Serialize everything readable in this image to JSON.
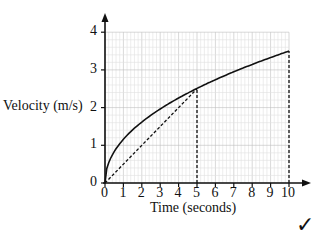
{
  "chart_data": {
    "type": "line",
    "title": "",
    "xlabel": "Time (seconds)",
    "ylabel": "Velocity (m/s)",
    "xlim": [
      0,
      10
    ],
    "ylim": [
      0,
      4
    ],
    "grid": true,
    "x_ticks": [
      "0",
      "1",
      "2",
      "3",
      "4",
      "5",
      "6",
      "7",
      "8",
      "9",
      "10"
    ],
    "y_ticks": [
      "0",
      "1",
      "2",
      "3",
      "4"
    ],
    "series": [
      {
        "name": "velocity curve",
        "style": "solid",
        "x": [
          0,
          0.25,
          0.5,
          1,
          2,
          3,
          4,
          5,
          6,
          7,
          8,
          9,
          10
        ],
        "y": [
          0,
          0.55,
          0.8,
          1.1,
          1.55,
          1.9,
          2.2,
          2.5,
          2.7,
          2.9,
          3.1,
          3.3,
          3.5
        ]
      },
      {
        "name": "chord 0-5",
        "style": "dashed",
        "x": [
          0,
          5
        ],
        "y": [
          0,
          2.5
        ]
      },
      {
        "name": "vertical at t=5",
        "style": "dashed",
        "x": [
          5,
          5
        ],
        "y": [
          0,
          2.5
        ]
      },
      {
        "name": "vertical at t=10",
        "style": "dashed",
        "x": [
          10,
          10
        ],
        "y": [
          0,
          3.5
        ]
      }
    ],
    "annotations": [
      "✓"
    ]
  },
  "labels": {
    "ylabel": "Velocity (m/s)",
    "xlabel": "Time (seconds)",
    "check": "✓"
  }
}
